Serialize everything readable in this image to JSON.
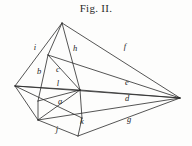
{
  "figure": {
    "caption": "Fig. II.",
    "type": "geometric-line-diagram",
    "stroke_color": "#2a2a2a",
    "background_color": "#fdfdfc",
    "text_color": "#242424",
    "width": 192,
    "height": 146,
    "vertices": {
      "apex": {
        "id": "apex",
        "x": 62,
        "y": 23
      },
      "left": {
        "id": "left",
        "x": 15,
        "y": 86
      },
      "right": {
        "id": "right",
        "x": 180,
        "y": 98
      },
      "inner_top": {
        "id": "inner_top",
        "x": 48,
        "y": 55
      },
      "hub": {
        "id": "hub",
        "x": 80,
        "y": 90
      },
      "lower_left": {
        "id": "lower_left",
        "x": 38,
        "y": 120
      },
      "bottom": {
        "id": "bottom",
        "x": 78,
        "y": 136
      },
      "inner_left": {
        "id": "inner_left",
        "x": 38,
        "y": 101
      },
      "k_node": {
        "id": "k_node",
        "x": 82,
        "y": 118
      }
    },
    "edges": [
      {
        "id": "apex-left",
        "from": "apex",
        "to": "left"
      },
      {
        "id": "apex-right",
        "from": "apex",
        "to": "right"
      },
      {
        "id": "apex-hub",
        "from": "apex",
        "to": "hub"
      },
      {
        "id": "apex-inner_top",
        "from": "apex",
        "to": "inner_top"
      },
      {
        "id": "left-right",
        "from": "left",
        "to": "right"
      },
      {
        "id": "left-hub",
        "from": "left",
        "to": "hub"
      },
      {
        "id": "left-lower_left",
        "from": "left",
        "to": "lower_left"
      },
      {
        "id": "left-k_node",
        "from": "left",
        "to": "k_node"
      },
      {
        "id": "inner_top-hub",
        "from": "inner_top",
        "to": "hub"
      },
      {
        "id": "inner_top-inner_left",
        "from": "inner_top",
        "to": "inner_left"
      },
      {
        "id": "inner_top-right",
        "from": "inner_top",
        "to": "right"
      },
      {
        "id": "inner_left-hub",
        "from": "inner_left",
        "to": "hub"
      },
      {
        "id": "inner_left-lower_left",
        "from": "inner_left",
        "to": "lower_left"
      },
      {
        "id": "lower_left-hub",
        "from": "lower_left",
        "to": "hub"
      },
      {
        "id": "lower_left-bottom",
        "from": "lower_left",
        "to": "bottom"
      },
      {
        "id": "lower_left-right",
        "from": "lower_left",
        "to": "right"
      },
      {
        "id": "hub-k_node",
        "from": "hub",
        "to": "k_node"
      },
      {
        "id": "hub-right",
        "from": "hub",
        "to": "right"
      },
      {
        "id": "bottom-right",
        "from": "bottom",
        "to": "right"
      },
      {
        "id": "bottom-k_node",
        "from": "bottom",
        "to": "k_node"
      }
    ],
    "labels": [
      {
        "id": "label-i",
        "text": "i",
        "x": 35,
        "y": 50
      },
      {
        "id": "label-h",
        "text": "h",
        "x": 75,
        "y": 51
      },
      {
        "id": "label-f",
        "text": "f",
        "x": 125,
        "y": 49
      },
      {
        "id": "label-b",
        "text": "b",
        "x": 39,
        "y": 74
      },
      {
        "id": "label-c",
        "text": "c",
        "x": 58,
        "y": 72
      },
      {
        "id": "label-l",
        "text": "l",
        "x": 58,
        "y": 86
      },
      {
        "id": "label-e",
        "text": "e",
        "x": 127,
        "y": 85
      },
      {
        "id": "label-a",
        "text": "a",
        "x": 60,
        "y": 104
      },
      {
        "id": "label-d",
        "text": "d",
        "x": 127,
        "y": 101
      },
      {
        "id": "label-j",
        "text": "j",
        "x": 57,
        "y": 132
      },
      {
        "id": "label-k",
        "text": "k",
        "x": 82,
        "y": 124
      },
      {
        "id": "label-g",
        "text": "g",
        "x": 129,
        "y": 122
      }
    ]
  }
}
